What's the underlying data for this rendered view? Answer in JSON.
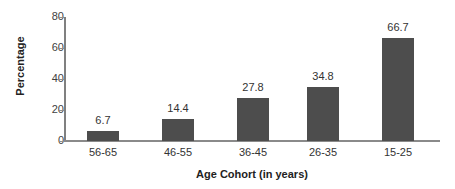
{
  "chart_data": {
    "type": "bar",
    "title": "",
    "subtitle": "",
    "categories": [
      "56-65",
      "46-55",
      "36-45",
      "26-35",
      "15-25"
    ],
    "values": [
      6.7,
      14.4,
      27.8,
      34.8,
      66.7
    ],
    "value_labels": [
      "6.7",
      "14.4",
      "27.8",
      "34.8",
      "66.7"
    ],
    "xlabel": "Age Cohort (in years)",
    "ylabel": "Percentage",
    "ylim": [
      0,
      80
    ],
    "ytick_labels": [
      "0",
      "20",
      "40",
      "60",
      "80"
    ],
    "ytick_values": [
      0,
      20,
      40,
      60,
      80
    ],
    "grid": false,
    "legend": false,
    "bar_color": "#4d4d4d",
    "axis_color": "#8a8a8a",
    "text_color": "#333333",
    "background": "#ffffff"
  }
}
